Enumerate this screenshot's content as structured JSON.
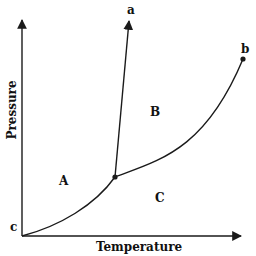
{
  "diagram": {
    "type": "phase-diagram",
    "axes": {
      "x_label": "Temperature",
      "y_label": "Pressure"
    },
    "regions": {
      "A": "A",
      "B": "B",
      "C": "C"
    },
    "points": {
      "a": "a",
      "b": "b",
      "c": "c"
    },
    "colors": {
      "line": "#1a1a1a",
      "background": "#ffffff"
    }
  }
}
